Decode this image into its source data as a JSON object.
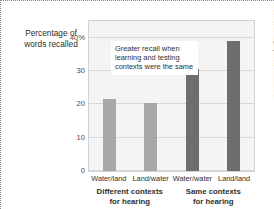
{
  "chart_data": {
    "type": "bar",
    "title": "",
    "ylabel": "Percentage of words recalled",
    "xlabel": "",
    "categories": [
      "Water/land",
      "Land/water",
      "Water/water",
      "Land/land"
    ],
    "values": [
      21.5,
      20.5,
      30.5,
      39.0
    ],
    "bar_colors": [
      "#a8a8a8",
      "#a8a8a8",
      "#6e6e6e",
      "#6e6e6e"
    ],
    "ylim": [
      0,
      45
    ],
    "yticks": [
      0,
      10,
      20,
      30,
      40
    ],
    "ytick_labels": [
      "0",
      "10",
      "20",
      "30",
      "40%"
    ],
    "grid": true,
    "legend": "none",
    "groups": [
      {
        "label_line1": "Different contexts",
        "label_line2": "for hearing"
      },
      {
        "label_line1": "Same contexts",
        "label_line2": "for hearing"
      }
    ],
    "annotations": [
      {
        "line1": "Greater recall when",
        "line2": "learning and testing",
        "line3": "contexts were the same"
      }
    ]
  },
  "credit": "Fred McConnaughey/Photo Researchers",
  "colors": {
    "plot_background": "#f4f4f4",
    "gridline": "#d8d8d8",
    "light_bar": "#a8a8a8",
    "dark_bar": "#6e6e6e",
    "text": "#2e2e2e"
  }
}
